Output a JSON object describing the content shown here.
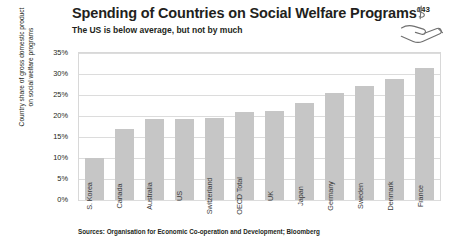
{
  "header": {
    "title": "Spending of Countries on Social Welfare Programs",
    "title_superscript": "143",
    "subtitle": "The US is below average, but not by much",
    "icon": "hand-holding-dollar-icon"
  },
  "source_note": "Sources: Organisation for Economic Co-operation and Development; Bloomberg",
  "colors": {
    "bar": "#c6c6c6",
    "gridline": "#dcdcdc",
    "plot_border": "#d8d8d8",
    "text": "#231f20",
    "background": "#ffffff"
  },
  "chart_data": {
    "type": "bar",
    "title": "Spending of Countries on Social Welfare Programs",
    "subtitle": "The US is below average, but not by much",
    "xlabel": "",
    "ylabel": "Country share of gross domestic product on social welfare programs",
    "ylabel_lines": [
      "Country share of gross domestic product",
      "on social welfare programs"
    ],
    "categories": [
      "S. Korea",
      "Canada",
      "Australia",
      "US",
      "Switzerland",
      "OECD Total",
      "UK",
      "Japan",
      "Germany",
      "Sweden",
      "Denmark",
      "France"
    ],
    "values": [
      10.0,
      17.0,
      19.2,
      19.3,
      19.6,
      21.0,
      21.3,
      23.0,
      25.5,
      27.2,
      28.9,
      31.5
    ],
    "value_labels": [
      "10%",
      "17%",
      "19%",
      "19%",
      "20%",
      "21%",
      "21%",
      "23%",
      "26%",
      "27%",
      "29%",
      "32%"
    ],
    "ylim": [
      0,
      35
    ],
    "ytick_values": [
      0,
      5,
      10,
      15,
      20,
      25,
      30,
      35
    ],
    "ytick_labels": [
      "0%",
      "5%",
      "10%",
      "15%",
      "20%",
      "25%",
      "30%",
      "35%"
    ],
    "grid": true,
    "legend": "none",
    "orientation": "vertical",
    "sorted": "ascending"
  }
}
